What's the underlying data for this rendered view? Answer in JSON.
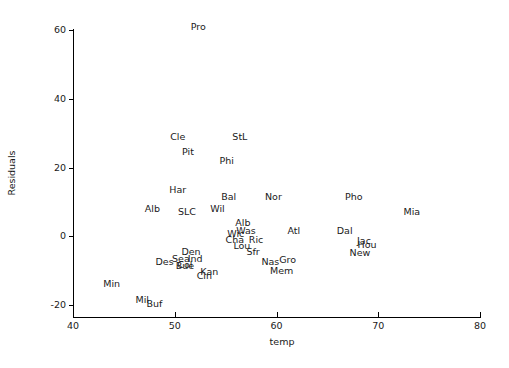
{
  "chart_data": {
    "type": "scatter",
    "title": "",
    "subtitle": "",
    "xlabel": "temp",
    "ylabel": "Residuals",
    "xlim": [
      40,
      80
    ],
    "ylim": [
      -25,
      67
    ],
    "xticks": [
      40,
      50,
      60,
      70,
      80
    ],
    "yticks": [
      -20,
      0,
      20,
      40,
      60
    ],
    "xtick_labels": [
      "40",
      "50",
      "60",
      "70",
      "80"
    ],
    "ytick_labels": [
      "-20",
      "0",
      "20",
      "40",
      "60"
    ],
    "grid": false,
    "legend": null,
    "marker_style": "text-label",
    "note": "Each data point is drawn as a 3-letter city abbreviation instead of a marker symbol.",
    "points": [
      {
        "label": "Pro",
        "x": 52.3,
        "y": 61.0
      },
      {
        "label": "Cle",
        "x": 50.3,
        "y": 29.0
      },
      {
        "label": "StL",
        "x": 56.4,
        "y": 29.0
      },
      {
        "label": "Pit",
        "x": 51.3,
        "y": 24.5
      },
      {
        "label": "Phi",
        "x": 55.1,
        "y": 22.0
      },
      {
        "label": "Har",
        "x": 50.3,
        "y": 13.5
      },
      {
        "label": "Bal",
        "x": 55.3,
        "y": 11.5
      },
      {
        "label": "Nor",
        "x": 59.7,
        "y": 11.5
      },
      {
        "label": "Pho",
        "x": 67.6,
        "y": 11.5
      },
      {
        "label": "Alb",
        "x": 47.8,
        "y": 8.0
      },
      {
        "label": "SLC",
        "x": 51.2,
        "y": 7.0
      },
      {
        "label": "Wil",
        "x": 54.2,
        "y": 8.0
      },
      {
        "label": "Mia",
        "x": 73.3,
        "y": 7.0
      },
      {
        "label": "Alb",
        "x": 56.7,
        "y": 4.0
      },
      {
        "label": "Was",
        "x": 57.0,
        "y": 1.5
      },
      {
        "label": "Wic",
        "x": 56.0,
        "y": 0.6
      },
      {
        "label": "Atl",
        "x": 61.7,
        "y": 1.5
      },
      {
        "label": "Dal",
        "x": 66.7,
        "y": 1.5
      },
      {
        "label": "Cha",
        "x": 55.9,
        "y": -1.0
      },
      {
        "label": "Ric",
        "x": 58.0,
        "y": -1.0
      },
      {
        "label": "Jac",
        "x": 68.6,
        "y": -1.5
      },
      {
        "label": "Hou",
        "x": 68.9,
        "y": -2.5
      },
      {
        "label": "Lou",
        "x": 56.6,
        "y": -2.8
      },
      {
        "label": "Den",
        "x": 51.6,
        "y": -4.5
      },
      {
        "label": "Sfr",
        "x": 57.7,
        "y": -4.5
      },
      {
        "label": "New",
        "x": 68.2,
        "y": -4.8
      },
      {
        "label": "Sea",
        "x": 50.6,
        "y": -6.5
      },
      {
        "label": "Ind",
        "x": 52.0,
        "y": -6.5
      },
      {
        "label": "Des",
        "x": 49.0,
        "y": -7.5
      },
      {
        "label": "Col",
        "x": 51.0,
        "y": -8.4
      },
      {
        "label": "Bue",
        "x": 51.0,
        "y": -8.6
      },
      {
        "label": "Nas",
        "x": 59.4,
        "y": -7.5
      },
      {
        "label": "Gro",
        "x": 61.1,
        "y": -7.0
      },
      {
        "label": "Mem",
        "x": 60.5,
        "y": -10.0
      },
      {
        "label": "Kan",
        "x": 53.4,
        "y": -10.5
      },
      {
        "label": "Cin",
        "x": 52.9,
        "y": -11.5
      },
      {
        "label": "Min",
        "x": 43.8,
        "y": -14.0
      },
      {
        "label": "Mil",
        "x": 46.8,
        "y": -18.5
      },
      {
        "label": "Buf",
        "x": 48.0,
        "y": -19.8
      }
    ]
  },
  "plot": {
    "x_axis_title": "temp",
    "y_axis_title": "Residuals"
  }
}
